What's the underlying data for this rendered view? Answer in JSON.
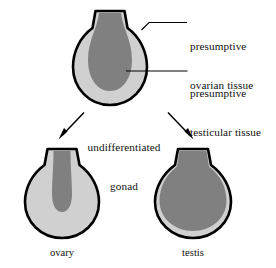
{
  "figure": {
    "colors": {
      "outline": "#000000",
      "light_tissue": "#d0d0d0",
      "dark_tissue": "#808080",
      "background": "#ffffff",
      "text": "#111111"
    }
  },
  "labels": {
    "ovarian_tissue": "presumptive\novarian tissue",
    "ovarian_tissue_line1": "presumptive",
    "ovarian_tissue_line2": "ovarian tissue",
    "testicular_tissue": "presumptive\ntesticular tissue",
    "testicular_tissue_line1": "presumptive",
    "testicular_tissue_line2": "testicular tissue",
    "undifferentiated_gonad_line1": "undifferentiated",
    "undifferentiated_gonad_line2": "gonad"
  },
  "captions": {
    "ovary": "ovary",
    "testis": "testis"
  },
  "structures": {
    "undifferentiated": {
      "name": "undifferentiated gonad",
      "outer_tissue": "presumptive ovarian tissue",
      "inner_tissue": "presumptive testicular tissue"
    },
    "ovary": {
      "name": "ovary",
      "outer_tissue": "ovarian tissue",
      "inner_tissue": "residual medullary tissue"
    },
    "testis": {
      "name": "testis",
      "outer_tissue": "residual cortical tissue",
      "inner_tissue": "testicular tissue"
    }
  },
  "arrows": [
    {
      "name": "arrow-to-ovary",
      "direction": "down-left"
    },
    {
      "name": "arrow-to-testis",
      "direction": "down-right"
    }
  ],
  "leaders": [
    {
      "name": "leader-ovarian-tissue",
      "target": "outer light tissue of undifferentiated gonad"
    },
    {
      "name": "leader-testicular-tissue",
      "target": "inner dark tissue of undifferentiated gonad"
    }
  ]
}
